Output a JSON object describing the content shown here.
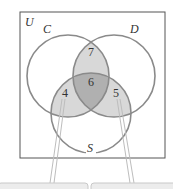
{
  "diagram": {
    "universe_label": "U",
    "sets": [
      {
        "name": "C"
      },
      {
        "name": "D"
      },
      {
        "name": "S"
      }
    ],
    "regions": {
      "C_and_D_only": "7",
      "C_and_D_and_S": "6",
      "C_and_S_only": "4",
      "D_and_S_only": "5"
    },
    "colors": {
      "circle_stroke": "#8a8a8a",
      "pair_fill": "#d8d8d8",
      "triple_fill": "#b0b0b0",
      "callout_fill": "#ececec"
    }
  }
}
